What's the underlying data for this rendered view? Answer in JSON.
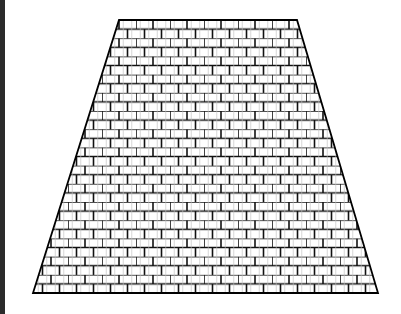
{
  "figure": {
    "shape": {
      "top_left": [
        119,
        20
      ],
      "top_right": [
        297,
        20
      ],
      "bottom_right": [
        378,
        293
      ],
      "bottom_left": [
        33,
        293
      ]
    },
    "pattern": {
      "type": "brick",
      "brick_width": 17,
      "brick_height": 9.1
    },
    "colors": {
      "stroke": "#000000",
      "mortar": "#111111",
      "fill": "#ffffff",
      "edge_strip": "#2b2b2b"
    }
  }
}
